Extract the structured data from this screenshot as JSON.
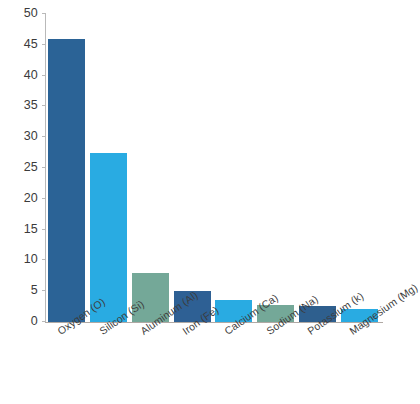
{
  "chart_data": {
    "type": "bar",
    "title": "",
    "subtitle": "",
    "xlabel": "",
    "ylabel": "",
    "categories": [
      "Oxygen (O)",
      "Silicon (Si)",
      "Aluminum (Al)",
      "Iron (Fe)",
      "Calcium (Ca)",
      "Sodium (Na)",
      "Potassium (k)",
      "Magnesium (Mg)"
    ],
    "values": [
      46.0,
      27.5,
      8.0,
      5.0,
      3.6,
      2.8,
      2.6,
      2.1
    ],
    "bar_colors": [
      "#2b6396",
      "#29abe2",
      "#74a898",
      "#2e6094",
      "#29abe2",
      "#74a898",
      "#2e5f8e",
      "#29abe2"
    ],
    "ylim": [
      0,
      50
    ],
    "yticks": [
      0,
      5,
      10,
      15,
      20,
      25,
      30,
      35,
      40,
      45,
      50
    ],
    "ytick_labels": [
      "0",
      "5",
      "10",
      "15",
      "20",
      "25",
      "30",
      "35",
      "40",
      "45",
      "50"
    ],
    "grid": false,
    "legend": null,
    "legend_position": "none",
    "axis_color": "#b9b9b9",
    "baseline_color": "#b0a9a4",
    "tick_label_color": "#3b3b3b",
    "category_label_rotation_deg": -35,
    "background_color": "#ffffff"
  }
}
